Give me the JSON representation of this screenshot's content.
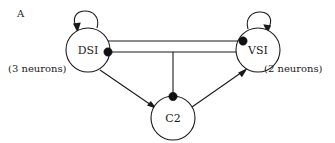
{
  "figure": {
    "panel_letter": "A",
    "background_color": "#ffffff",
    "line_color": "#1a1a1a",
    "synapse_color": "#111111"
  },
  "nodes": [
    {
      "id": "DSI",
      "label": "DSI",
      "cx": 88,
      "cy": 50,
      "r": 22
    },
    {
      "id": "VSI",
      "label": "VSI",
      "cx": 258,
      "cy": 50,
      "r": 22
    },
    {
      "id": "C2",
      "label": "C2",
      "cx": 173,
      "cy": 118,
      "r": 22
    }
  ],
  "annotations": [
    {
      "name": "dsi-neuron-count",
      "text": "(3 neurons)",
      "x": 8,
      "y": 68
    },
    {
      "name": "vsi-neuron-count",
      "text": "(2 neurons)",
      "x": 264,
      "y": 68
    }
  ],
  "connections": [
    {
      "from": "DSI",
      "to": "VSI",
      "kind": "inhibitory",
      "terminal": "dot",
      "note": "upper horizontal line, dot at VSI end"
    },
    {
      "from": "VSI",
      "to": "DSI",
      "kind": "inhibitory",
      "terminal": "dot",
      "note": "lower horizontal line, dot at DSI end"
    },
    {
      "from": "VSI",
      "to": "C2",
      "kind": "inhibitory",
      "terminal": "dot",
      "note": "vertical branch down to C2, dot at C2 top"
    },
    {
      "from": "DSI",
      "to": "C2",
      "kind": "excitatory",
      "terminal": "arrow"
    },
    {
      "from": "C2",
      "to": "VSI",
      "kind": "excitatory",
      "terminal": "arrow"
    },
    {
      "from": "DSI",
      "to": "DSI",
      "kind": "excitatory",
      "terminal": "arrow",
      "note": "self loop above node"
    },
    {
      "from": "VSI",
      "to": "VSI",
      "kind": "excitatory",
      "terminal": "arrow",
      "note": "self loop above node"
    }
  ]
}
